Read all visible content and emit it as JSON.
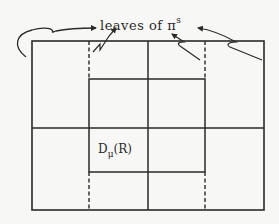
{
  "diagram": {
    "annotation": {
      "text": "leaves of π",
      "superscript": "s"
    },
    "region_label": {
      "text": "D",
      "subscript": "μ",
      "argument": "(R)"
    },
    "colors": {
      "line": "#2a2a2a",
      "background": "#f7f7f5"
    },
    "geometry": {
      "outer_rect": {
        "x": 32,
        "y": 41,
        "w": 232,
        "h": 169
      },
      "inner_square": {
        "x": 89,
        "y": 79,
        "w": 116,
        "h": 93
      },
      "mid_vertical_x": 148,
      "mid_horizontal_y": 128,
      "dashed_lines_x": [
        89,
        205
      ]
    },
    "elements": [
      "outer rectangle",
      "inner square",
      "solid vertical midline",
      "solid horizontal midline",
      "dashed vertical leaf lines",
      "curved pointer arrows",
      "zigzag break marks"
    ]
  }
}
